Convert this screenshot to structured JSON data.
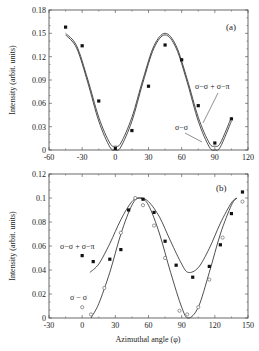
{
  "chart_data": [
    {
      "type": "scatter",
      "panel_label": "(a)",
      "title": "",
      "xlabel": "",
      "ylabel": "Intensity (arbit. units)",
      "xlim": [
        -60,
        120
      ],
      "ylim": [
        0,
        0.18
      ],
      "xticks": [
        "-60",
        "-30",
        "0",
        "30",
        "60",
        "90",
        "120"
      ],
      "yticks": [
        "0",
        "0.03",
        "0.06",
        "0.09",
        "0.12",
        "0.15",
        "0.18"
      ],
      "grid": false,
      "series": [
        {
          "name": "data",
          "marker": "filled-square",
          "x": [
            -45,
            -30,
            -15,
            0,
            15,
            30,
            45,
            60,
            75,
            90,
            105
          ],
          "y": [
            0.158,
            0.134,
            0.063,
            0.002,
            0.025,
            0.082,
            0.135,
            0.116,
            0.057,
            0.009,
            0.04
          ]
        },
        {
          "name": "σ−σ",
          "type": "line",
          "x": [
            -45,
            -35,
            -25,
            -15,
            -5,
            0,
            5,
            15,
            25,
            35,
            45,
            55,
            65,
            75,
            85,
            90,
            95,
            105
          ],
          "y": [
            0.148,
            0.131,
            0.087,
            0.037,
            0.004,
            0.0,
            0.004,
            0.037,
            0.087,
            0.131,
            0.148,
            0.131,
            0.087,
            0.037,
            0.004,
            0.0,
            0.004,
            0.037
          ]
        },
        {
          "name": "σ−σ + σ−π",
          "type": "line",
          "x": [
            -45,
            -35,
            -25,
            -15,
            -5,
            0,
            5,
            15,
            25,
            35,
            45,
            55,
            65,
            75,
            85,
            90,
            95,
            105
          ],
          "y": [
            0.15,
            0.134,
            0.091,
            0.042,
            0.009,
            0.005,
            0.009,
            0.042,
            0.091,
            0.134,
            0.15,
            0.134,
            0.091,
            0.042,
            0.009,
            0.005,
            0.009,
            0.042
          ]
        }
      ],
      "annotations": [
        "(a)",
        "σ−σ + σ−π",
        "σ−σ"
      ]
    },
    {
      "type": "scatter",
      "panel_label": "(b)",
      "title": "",
      "xlabel": "Azimuthal angle (φ)",
      "ylabel": "Intensity (arbit. units)",
      "xlim": [
        -30,
        150
      ],
      "ylim": [
        0,
        0.12
      ],
      "xticks": [
        "-30",
        "0",
        "30",
        "60",
        "90",
        "120",
        "150"
      ],
      "yticks": [
        "0",
        "0.02",
        "0.04",
        "0.06",
        "0.08",
        "0.1",
        "0.12"
      ],
      "grid": false,
      "series": [
        {
          "name": "σ−σ + σ−π data",
          "marker": "filled-square",
          "x": [
            0,
            10,
            25,
            35,
            42,
            55,
            65,
            75,
            85,
            100,
            115,
            125,
            135,
            145
          ],
          "y": [
            0.052,
            0.047,
            0.049,
            0.057,
            0.09,
            0.099,
            0.088,
            0.064,
            0.044,
            0.034,
            0.043,
            0.061,
            0.087,
            0.105
          ]
        },
        {
          "name": "σ−σ data",
          "marker": "open-circle",
          "x": [
            0,
            8,
            20,
            35,
            48,
            55,
            65,
            75,
            88,
            95,
            105,
            115,
            127,
            145
          ],
          "y": [
            0.009,
            0.003,
            0.025,
            0.071,
            0.1,
            0.094,
            0.077,
            0.05,
            0.006,
            0.003,
            0.009,
            0.032,
            0.067,
            0.097
          ]
        },
        {
          "name": "σ−σ + σ−π",
          "type": "line",
          "x": [
            7,
            15,
            25,
            35,
            45,
            52,
            60,
            70,
            80,
            90,
            96,
            105,
            115,
            125,
            135,
            140
          ],
          "y": [
            0.038,
            0.045,
            0.062,
            0.082,
            0.097,
            0.1,
            0.097,
            0.084,
            0.064,
            0.045,
            0.038,
            0.042,
            0.058,
            0.079,
            0.096,
            0.1
          ]
        },
        {
          "name": "σ−σ",
          "type": "line",
          "x": [
            8,
            15,
            25,
            35,
            45,
            52,
            60,
            70,
            80,
            90,
            96,
            105,
            115,
            125,
            135,
            140
          ],
          "y": [
            0.0,
            0.012,
            0.038,
            0.07,
            0.094,
            0.1,
            0.094,
            0.07,
            0.038,
            0.009,
            0.0,
            0.009,
            0.038,
            0.07,
            0.094,
            0.1
          ]
        }
      ],
      "annotations": [
        "(b)",
        "σ−σ + σ−π",
        "σ − σ"
      ]
    }
  ],
  "labels": {
    "panel_a": "(a)",
    "panel_b": "(b)",
    "a_curve_sum": "σ−σ + σ−π",
    "a_curve_ss": "σ−σ",
    "b_curve_sum": "σ−σ + σ−π",
    "b_curve_ss": "σ − σ",
    "ylabel": "Intensity (arbit. units)",
    "xlabel": "Azimuthal angle (φ)"
  }
}
